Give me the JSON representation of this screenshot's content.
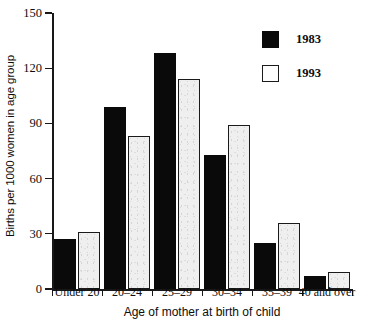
{
  "chart_data": {
    "type": "bar",
    "title": "",
    "xlabel": "Age of mother at birth of child",
    "ylabel": "Births per 1000 women in age group",
    "categories": [
      "Under 20",
      "20–24",
      "25–29",
      "30–34",
      "35–39",
      "40 and over"
    ],
    "series": [
      {
        "name": "1983",
        "values": [
          27,
          99,
          128,
          73,
          25,
          7
        ],
        "color": "#0a0a0a",
        "style": "filled-black"
      },
      {
        "name": "1993",
        "values": [
          31,
          83,
          114,
          89,
          36,
          9
        ],
        "color": "#efefef",
        "style": "outlined-white"
      }
    ],
    "ylim": [
      0,
      150
    ],
    "yticks": [
      0,
      30,
      60,
      90,
      120,
      150
    ],
    "ytick_labels": [
      "0",
      "30",
      "60",
      "90",
      "120",
      "150"
    ],
    "grid": false,
    "legend_position": "top-right",
    "legend_entries": [
      "1983",
      "1993"
    ]
  },
  "axes": {
    "y_title": "Births per 1000 women in age group",
    "x_title": "Age of mother at birth of child"
  },
  "legend": {
    "items": [
      {
        "label": "1983",
        "swatch": "filled-square-icon"
      },
      {
        "label": "1993",
        "swatch": "outlined-square-icon"
      }
    ]
  }
}
